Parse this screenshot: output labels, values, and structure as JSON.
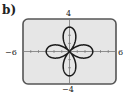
{
  "panel_label": "b)",
  "chart_data": {
    "type": "line",
    "subtype": "polar-rose",
    "equation": "r = 3cos(2θ)",
    "series": [
      {
        "name": "four-leaf rose",
        "amplitude": 3,
        "petals": 4,
        "theta_range": [
          0,
          6.2832
        ],
        "color": "#1a1a1a"
      }
    ],
    "xlim": [
      -6,
      6
    ],
    "ylim": [
      -4,
      4
    ],
    "x_tick_step": 1,
    "y_tick_step": 1,
    "tick_labels": {
      "xmin": "−6",
      "xmax": "6",
      "ymin": "−4",
      "ymax": "4"
    },
    "grid": false,
    "title": "",
    "xlabel": "",
    "ylabel": ""
  },
  "colors": {
    "screen": "#e6e6e6",
    "frame": "#555555",
    "curve": "#1a1a1a",
    "axis": "#777777"
  }
}
